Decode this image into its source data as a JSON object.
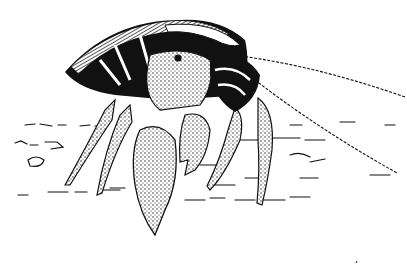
{
  "image": {
    "subject": "Hermit crab line illustration",
    "style": "black ink on white",
    "background_color": "#ffffff",
    "ink_color": "#111111"
  }
}
